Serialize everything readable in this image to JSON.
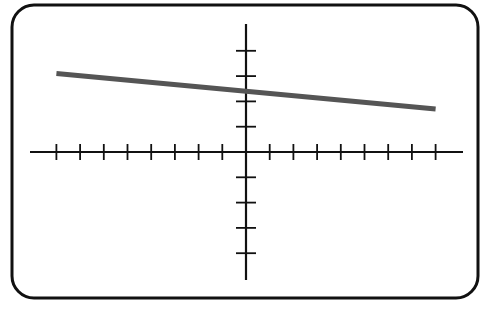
{
  "chart_data": {
    "type": "line",
    "title": "",
    "xlabel": "",
    "ylabel": "",
    "xlim": [
      -9,
      9
    ],
    "ylim": [
      -5,
      5
    ],
    "x_ticks": [
      -8,
      -7,
      -6,
      -5,
      -4,
      -3,
      -2,
      -1,
      1,
      2,
      3,
      4,
      5,
      6,
      7,
      8
    ],
    "y_ticks": [
      -4,
      -3,
      -2,
      -1,
      1,
      2,
      3,
      4
    ],
    "tick_labels_shown": false,
    "grid": false,
    "legend": null,
    "series": [
      {
        "name": "line",
        "color": "#555555",
        "x": [
          -8,
          8
        ],
        "values": [
          3.1,
          1.7
        ]
      }
    ],
    "y_intercept": 2.4,
    "slope": -0.09
  },
  "colors": {
    "frame": "#111111",
    "axes": "#111111",
    "line": "#555555",
    "background": "#ffffff"
  }
}
